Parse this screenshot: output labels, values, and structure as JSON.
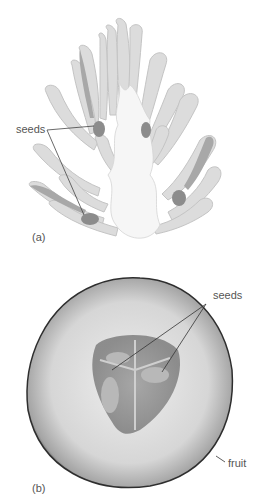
{
  "figure": {
    "panel_a": {
      "letter": "(a)",
      "labels": {
        "seeds": "seeds"
      },
      "colors": {
        "lobe": "#dcdcdc",
        "lobe_stroke": "#c4c4c4",
        "core": "#f6f6f6",
        "seed": "#8c8c8c",
        "seed_strip": "#a8a8a8"
      }
    },
    "panel_b": {
      "letter": "(b)",
      "labels": {
        "seeds": "seeds",
        "fruit": "fruit"
      },
      "colors": {
        "flesh": "#d8d8d8",
        "rim": "#3a3a3a",
        "core": "#8a8a8a",
        "seed": "#b4b4b4"
      }
    }
  }
}
